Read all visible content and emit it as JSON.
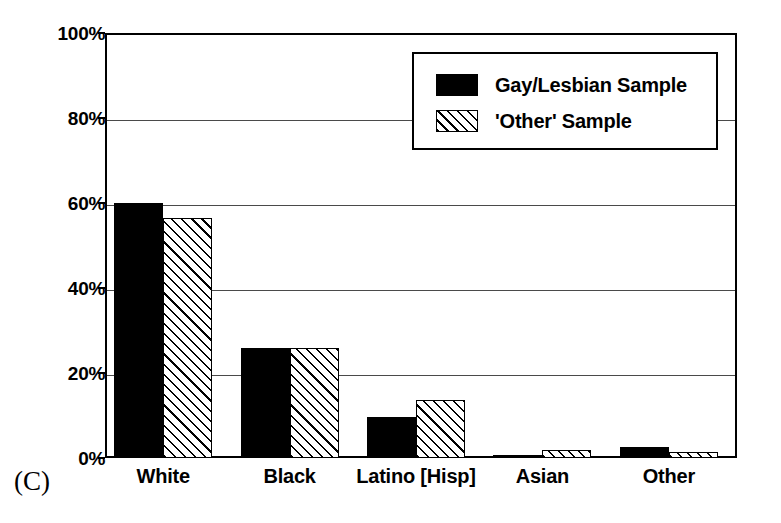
{
  "figure": {
    "panel_label": "(C)"
  },
  "chart_data": {
    "type": "bar",
    "title": "",
    "xlabel": "",
    "ylabel": "",
    "categories": [
      "White",
      "Black",
      "Latino [Hisp]",
      "Asian",
      "Other"
    ],
    "series": [
      {
        "name": "Gay/Lesbian Sample",
        "pattern": "solid-black",
        "values": [
          60.0,
          26.0,
          9.6,
          0.7,
          2.6
        ]
      },
      {
        "name": "'Other' Sample",
        "pattern": "diagonal-hatch",
        "values": [
          56.5,
          26.0,
          13.6,
          1.8,
          1.3
        ]
      }
    ],
    "ylim": [
      0,
      100
    ],
    "yticks": [
      0,
      20,
      40,
      60,
      80,
      100
    ],
    "ytick_labels": [
      "0%",
      "20%",
      "40%",
      "60%",
      "80%",
      "100%"
    ],
    "grid": true,
    "grid_axis": "y",
    "legend_position": "upper-right",
    "value_unit": "%"
  },
  "legend": {
    "entries": [
      {
        "label": "Gay/Lesbian Sample"
      },
      {
        "label": "'Other' Sample"
      }
    ]
  }
}
